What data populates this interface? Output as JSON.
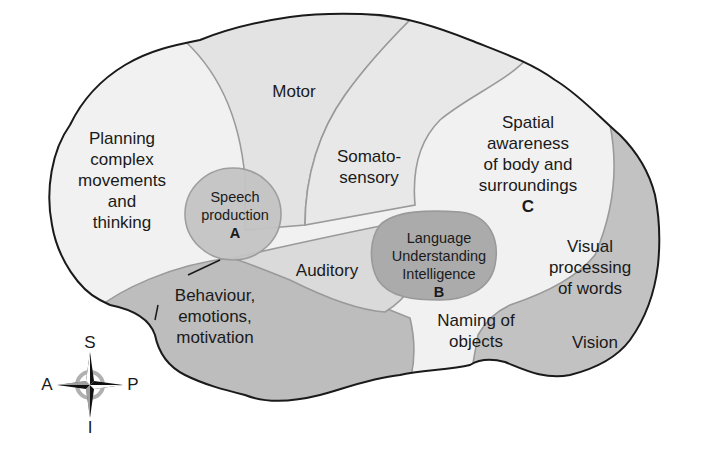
{
  "diagram": {
    "type": "brain-lateral-functional-areas",
    "colors": {
      "outline": "#1a1a1a",
      "region_boundary": "#9a9a9a",
      "light_region": "#f0f0f0",
      "mid_region": "#e2e2e2",
      "dark_region": "#bdbdbd",
      "darker_region": "#a9a9a9",
      "text": "#1a1a1a"
    },
    "regions": {
      "planning": {
        "lines": [
          "Planning",
          "complex",
          "movements",
          "and",
          "thinking"
        ]
      },
      "motor": {
        "lines": [
          "Motor"
        ]
      },
      "somatosensory": {
        "lines": [
          "Somato-",
          "sensory"
        ]
      },
      "spatial": {
        "lines": [
          "Spatial",
          "awareness",
          "of body and",
          "surroundings"
        ],
        "letter": "C"
      },
      "speech": {
        "lines": [
          "Speech",
          "production"
        ],
        "letter": "A"
      },
      "language": {
        "lines": [
          "Language",
          "Understanding",
          "Intelligence"
        ],
        "letter": "B"
      },
      "auditory": {
        "lines": [
          "Auditory"
        ]
      },
      "behaviour": {
        "lines": [
          "Behaviour,",
          "emotions,",
          "motivation"
        ]
      },
      "visual_words": {
        "lines": [
          "Visual",
          "processing",
          "of words"
        ]
      },
      "naming": {
        "lines": [
          "Naming of",
          "objects"
        ]
      },
      "vision": {
        "lines": [
          "Vision"
        ]
      }
    },
    "compass": {
      "superior": "S",
      "inferior": "I",
      "anterior": "A",
      "posterior": "P"
    }
  }
}
